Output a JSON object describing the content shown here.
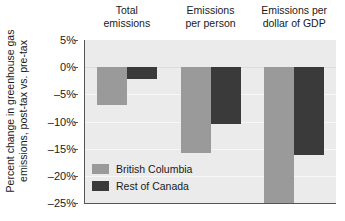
{
  "chart_data": {
    "type": "bar",
    "title": "",
    "xlabel": "",
    "ylabel_line1": "Percent change in greenhouse gas",
    "ylabel_line2": "emissions, post-tax vs. pre-tax",
    "categories": [
      {
        "line1": "Total",
        "line2": "emissions"
      },
      {
        "line1": "Emissions",
        "line2": "per person"
      },
      {
        "line1": "Emissions per",
        "line2": "dollar of GDP"
      }
    ],
    "series": [
      {
        "name": "British Columbia",
        "color": "#9a9a9a",
        "values": [
          -7.0,
          -15.8,
          -25.0
        ]
      },
      {
        "name": "Rest of Canada",
        "color": "#3a3a3a",
        "values": [
          -2.1,
          -10.5,
          -16.2
        ]
      }
    ],
    "ylim": [
      -25,
      5
    ],
    "yticks": [
      5,
      0,
      -5,
      -10,
      -15,
      -20,
      -25
    ],
    "ytick_labels": [
      "5%",
      "0%",
      "-5%",
      "-10%",
      "-15%",
      "-20%",
      "-25%"
    ],
    "grid": true,
    "legend_position": "inside-bottom-left",
    "plot_background": "#ebebeb",
    "axis_color": "#555555"
  },
  "legend": {
    "entries": [
      {
        "label": "British Columbia",
        "color": "#9a9a9a"
      },
      {
        "label": "Rest of Canada",
        "color": "#3a3a3a"
      }
    ]
  }
}
